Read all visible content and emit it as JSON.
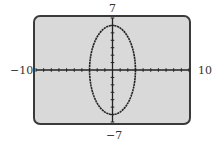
{
  "chart_data": {
    "type": "line",
    "title": "",
    "equation": "x^2/9 + y^2/36 = 1",
    "series": [
      {
        "name": "ellipse",
        "center": [
          0,
          0
        ],
        "semi_axis_x": 3,
        "semi_axis_y": 6,
        "points": [
          [
            3,
            0
          ],
          [
            0,
            6
          ],
          [
            -3,
            0
          ],
          [
            0,
            -6
          ]
        ]
      }
    ],
    "xlim": [
      -10,
      10
    ],
    "ylim": [
      -7,
      7
    ],
    "xscale": 1,
    "yscale": 1,
    "xlabel": "",
    "ylabel": "",
    "tick_labels": {
      "xmin": "−10",
      "xmax": "10",
      "ymin": "−7",
      "ymax": "7"
    },
    "grid": false,
    "legend": null
  },
  "colors": {
    "screen_bg": "#d9d9d9",
    "frame": "#3a3a3a",
    "plot": "#222222"
  }
}
